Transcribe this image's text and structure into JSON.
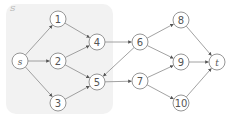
{
  "diagram": {
    "type": "directed-graph",
    "region": {
      "label": "S",
      "x": 6,
      "y": 4,
      "width": 107,
      "height": 110,
      "radius": 10,
      "fill": "#f2f2f2"
    },
    "nodes": [
      {
        "id": "s",
        "label": "s",
        "x": 20,
        "y": 61,
        "italic": true
      },
      {
        "id": "1",
        "label": "1",
        "x": 58,
        "y": 19
      },
      {
        "id": "2",
        "label": "2",
        "x": 58,
        "y": 61
      },
      {
        "id": "3",
        "label": "3",
        "x": 58,
        "y": 103
      },
      {
        "id": "4",
        "label": "4",
        "x": 97,
        "y": 42
      },
      {
        "id": "5",
        "label": "5",
        "x": 97,
        "y": 82
      },
      {
        "id": "6",
        "label": "6",
        "x": 140,
        "y": 42
      },
      {
        "id": "7",
        "label": "7",
        "x": 140,
        "y": 81
      },
      {
        "id": "8",
        "label": "8",
        "x": 181,
        "y": 20
      },
      {
        "id": "9",
        "label": "9",
        "x": 181,
        "y": 62
      },
      {
        "id": "10",
        "label": "10",
        "x": 181,
        "y": 103
      },
      {
        "id": "t",
        "label": "t",
        "x": 217,
        "y": 62,
        "italic": true
      }
    ],
    "edges": [
      {
        "from": "s",
        "to": "1"
      },
      {
        "from": "s",
        "to": "2"
      },
      {
        "from": "s",
        "to": "3"
      },
      {
        "from": "1",
        "to": "4"
      },
      {
        "from": "2",
        "to": "4"
      },
      {
        "from": "2",
        "to": "5"
      },
      {
        "from": "3",
        "to": "5"
      },
      {
        "from": "4",
        "to": "6"
      },
      {
        "from": "5",
        "to": "7"
      },
      {
        "from": "6",
        "to": "5"
      },
      {
        "from": "6",
        "to": "8"
      },
      {
        "from": "6",
        "to": "9"
      },
      {
        "from": "7",
        "to": "9"
      },
      {
        "from": "7",
        "to": "10"
      },
      {
        "from": "8",
        "to": "t"
      },
      {
        "from": "9",
        "to": "t"
      },
      {
        "from": "10",
        "to": "t"
      }
    ],
    "node_radius": 8,
    "colors": {
      "stroke": "#8a8a8a",
      "label": "#555555",
      "region_fill": "#f2f2f2",
      "region_label": "#b5b5b5"
    }
  }
}
